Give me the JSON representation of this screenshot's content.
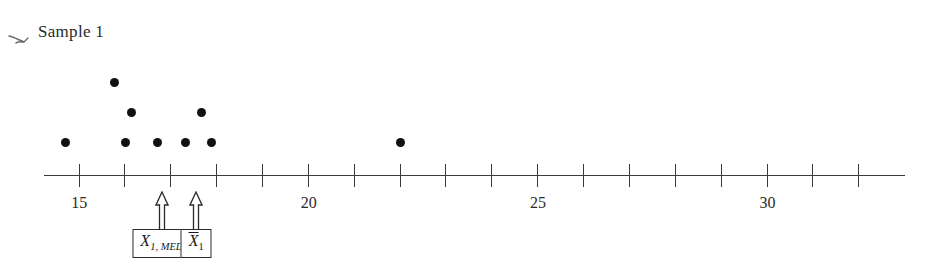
{
  "figure": {
    "title": "Sample 1",
    "scan_artifact_icon": "pen-stroke-mark"
  },
  "chart_data": {
    "type": "scatter",
    "subtype": "dot-plot",
    "title": "Sample 1",
    "xlabel": "",
    "ylabel": "",
    "xlim": [
      14.23,
      33.0
    ],
    "grid": false,
    "legend_position": "none",
    "axis_tick_step": 1,
    "tick_values": [
      15,
      16,
      17,
      18,
      19,
      20,
      21,
      22,
      23,
      24,
      25,
      26,
      27,
      28,
      29,
      30,
      31,
      32
    ],
    "tick_labels": [
      {
        "value": 15,
        "label": "15"
      },
      {
        "value": 20,
        "label": "20"
      },
      {
        "value": 25,
        "label": "25"
      },
      {
        "value": 30,
        "label": "30"
      }
    ],
    "values": [
      14.7,
      16.0,
      16.2,
      16.4,
      16.7,
      17.3,
      17.5,
      17.7,
      17.9,
      17.9,
      22.0
    ],
    "points": [
      {
        "x": 14.7,
        "stack": 1
      },
      {
        "x": 16.0,
        "stack": 1
      },
      {
        "x": 16.0,
        "stack": 2
      },
      {
        "x": 16.0,
        "stack": 3
      },
      {
        "x": 16.7,
        "stack": 1
      },
      {
        "x": 17.4,
        "stack": 1
      },
      {
        "x": 17.5,
        "stack": 2
      },
      {
        "x": 17.8,
        "stack": 1
      },
      {
        "x": 22.0,
        "stack": 1
      }
    ],
    "markers": [
      {
        "name": "median",
        "value": 16.8,
        "label_plain": "X1, MED",
        "box_text": "X",
        "sub_text": "1, MED"
      },
      {
        "name": "mean",
        "value": 17.55,
        "label_plain": "Xbar1",
        "box_text": "X",
        "sub_text": "1"
      }
    ]
  },
  "colors": {
    "dot": "#111111",
    "axis": "#3a3a3a",
    "text": "#2a2a2a",
    "box_border": "#2a2a2a",
    "background": "#ffffff"
  }
}
